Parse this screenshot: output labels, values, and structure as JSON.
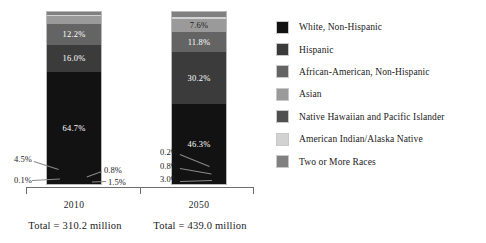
{
  "chart_data": {
    "type": "bar",
    "subtype": "100% stacked bar",
    "title": "",
    "xlabel": "",
    "ylabel": "",
    "ylim": [
      0,
      100
    ],
    "grid": false,
    "legend_position": "right",
    "categories": [
      "2010",
      "2050"
    ],
    "category_totals": [
      "Total = 310.2 million",
      "Total = 439.0 million"
    ],
    "series": [
      {
        "name": "White, Non-Hispanic",
        "color": "#121212",
        "values": [
          64.7,
          46.3
        ],
        "labels": [
          "64.7%",
          "46.3%"
        ]
      },
      {
        "name": "Hispanic",
        "color": "#3b3b3b",
        "values": [
          16.0,
          30.2
        ],
        "labels": [
          "16.0%",
          "30.2%"
        ]
      },
      {
        "name": "African-American, Non-Hispanic",
        "color": "#646464",
        "values": [
          12.2,
          11.8
        ],
        "labels": [
          "12.2%",
          "11.8%"
        ]
      },
      {
        "name": "Asian",
        "color": "#9a9a9a",
        "values": [
          4.5,
          7.6
        ],
        "labels": [
          "4.5%",
          "7.6%"
        ]
      },
      {
        "name": "Native Hawaiian and Pacific Islander",
        "color": "#4f4f4f",
        "values": [
          0.1,
          0.2
        ],
        "labels": [
          "0.1%",
          "0.2%"
        ]
      },
      {
        "name": "American Indian/Alaska Native",
        "color": "#d2d2d2",
        "values": [
          0.8,
          0.8
        ],
        "labels": [
          "0.8%",
          "0.8%"
        ]
      },
      {
        "name": "Two or More Races",
        "color": "#808080",
        "values": [
          1.5,
          3.0
        ],
        "labels": [
          "1.5%",
          "3.0%"
        ]
      }
    ]
  },
  "legend": {
    "items": [
      {
        "label": "White, Non-Hispanic",
        "color": "#121212"
      },
      {
        "label": "Hispanic",
        "color": "#3b3b3b"
      },
      {
        "label": "African-American, Non-Hispanic",
        "color": "#646464"
      },
      {
        "label": "Asian",
        "color": "#9a9a9a"
      },
      {
        "label": "Native Hawaiian and Pacific Islander",
        "color": "#4f4f4f"
      },
      {
        "label": "American Indian/Alaska Native",
        "color": "#d2d2d2"
      },
      {
        "label": "Two or More Races",
        "color": "#808080"
      }
    ]
  },
  "axis": {
    "year_2010": "2010",
    "year_2050": "2050",
    "total_2010": "Total = 310.2 million",
    "total_2050": "Total = 439.0 million"
  },
  "callouts": {
    "b0_asian": "4.5%",
    "b0_nhpi": "0.1%",
    "b0_aian": "0.8%",
    "b0_two": "1.5%",
    "b1_nhpi": "0.2%",
    "b1_aian": "0.8%",
    "b1_two": "3.0%"
  },
  "inbar_labels": {
    "b0_white": "64.7%",
    "b0_hispanic": "16.0%",
    "b0_black": "12.2%",
    "b1_white": "46.3%",
    "b1_hispanic": "30.2%",
    "b1_black": "11.8%",
    "b1_asian": "7.6%"
  }
}
